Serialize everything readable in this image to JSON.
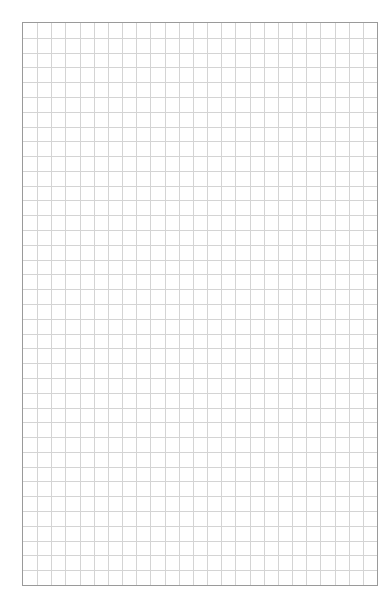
{
  "sheet": {
    "type": "graph-paper",
    "columns": 25,
    "rows": 38,
    "line_color": "#d4d4d4",
    "border_color": "#9a9a9a",
    "background": "#ffffff"
  }
}
